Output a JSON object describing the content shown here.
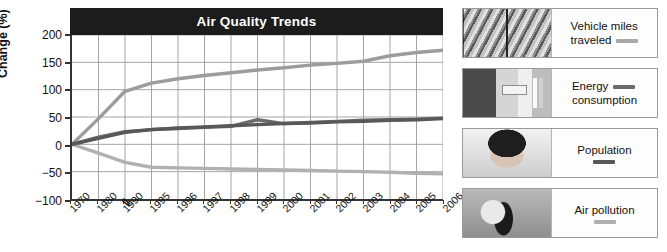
{
  "chart_data": {
    "type": "line",
    "title": "Air Quality Trends",
    "xlabel": "",
    "ylabel": "Change (%)",
    "ylim": [
      -100,
      200
    ],
    "yticks": [
      200,
      150,
      100,
      50,
      0,
      -50,
      -100
    ],
    "ytick_labels": [
      "200",
      "150",
      "100",
      "50",
      "0",
      "−50",
      "−100"
    ],
    "grid": true,
    "axis_break": {
      "between": [
        "1990",
        "1995"
      ],
      "symbol": "//"
    },
    "legend_position": "right",
    "categories": [
      "1970",
      "1980",
      "1990",
      "1995",
      "1996",
      "1997",
      "1998",
      "1999",
      "2000",
      "2001",
      "2002",
      "2003",
      "2004",
      "2005",
      "2006"
    ],
    "series": [
      {
        "name": "Vehicle miles traveled",
        "color": "#9c9c9c",
        "values": [
          0,
          47,
          97,
          112,
          120,
          126,
          131,
          136,
          140,
          145,
          148,
          152,
          162,
          168,
          172
        ]
      },
      {
        "name": "Energy consumption",
        "color": "#6b6b6b",
        "values": [
          0,
          13,
          23,
          27,
          29,
          31,
          33,
          45,
          38,
          40,
          42,
          44,
          45,
          46,
          48
        ]
      },
      {
        "name": "Population",
        "color": "#585858",
        "values": [
          0,
          11,
          22,
          27,
          30,
          32,
          34,
          36,
          38,
          39,
          41,
          42,
          44,
          45,
          47
        ]
      },
      {
        "name": "Air pollution",
        "color": "#b0b0b0",
        "values": [
          0,
          -16,
          -33,
          -42,
          -43,
          -44,
          -45,
          -46,
          -47,
          -48,
          -49,
          -50,
          -51,
          -53,
          -54
        ]
      }
    ]
  },
  "legend": {
    "items": [
      {
        "label_line1": "Vehicle miles",
        "label_line2": "traveled",
        "swatch_color": "#a8a8a8",
        "photo": "traffic-photo",
        "layout": "inline"
      },
      {
        "label_line1": "Energy",
        "label_line2": "consumption",
        "swatch_color": "#6b6b6b",
        "photo": "energy-photo",
        "layout": "inline"
      },
      {
        "label_line1": "Population",
        "label_line2": "",
        "swatch_color": "#585858",
        "photo": "baby-photo",
        "layout": "stacked"
      },
      {
        "label_line1": "Air pollution",
        "label_line2": "",
        "swatch_color": "#b0b0b0",
        "photo": "smoke-photo",
        "layout": "stacked"
      }
    ]
  },
  "colors": {
    "title_bar_bg": "#1c1c1c",
    "title_text": "#ffffff",
    "axis": "#333333",
    "grid": "#9b9b9b",
    "plot_bg": "#ffffff"
  }
}
